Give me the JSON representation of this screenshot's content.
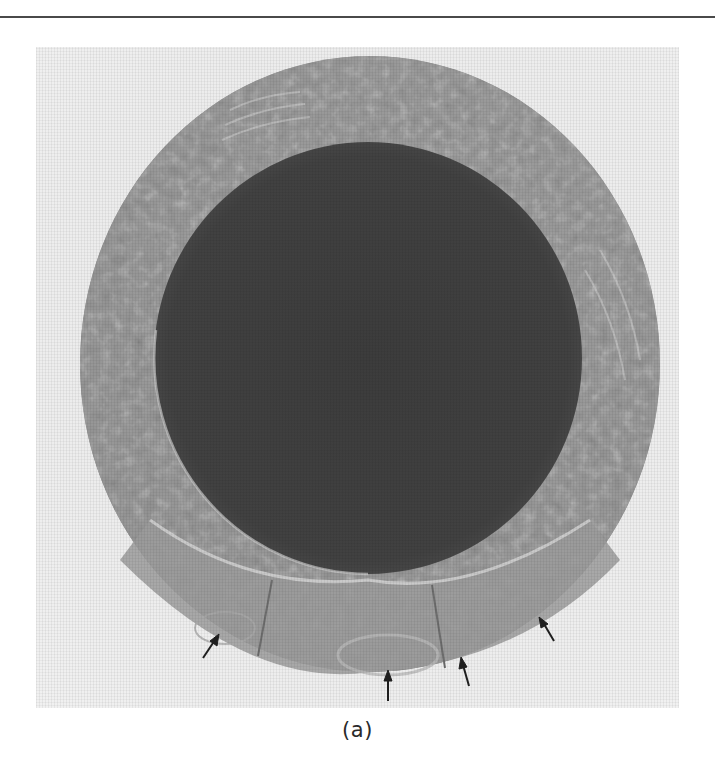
{
  "page": {
    "top_rule": true
  },
  "figure": {
    "panel_label": "(a)",
    "annotations": {
      "arrow_count": 5,
      "arrows": [
        {
          "id": 1,
          "tail": [
            203,
            658
          ],
          "head": [
            218,
            635
          ]
        },
        {
          "id": 2,
          "tail": [
            388,
            700
          ],
          "head": [
            388,
            672
          ]
        },
        {
          "id": 3,
          "tail": [
            468,
            685
          ],
          "head": [
            461,
            658
          ]
        },
        {
          "id": 4,
          "tail": [
            553,
            640
          ],
          "head": [
            540,
            618
          ]
        }
      ]
    },
    "colors": {
      "background_paper": "#ececec",
      "outer_ring": "#8e8e8e",
      "outer_ring_light": "#b4b4b4",
      "inner_core": "#3e3e3e",
      "arrow": "#1e1e1e"
    }
  }
}
